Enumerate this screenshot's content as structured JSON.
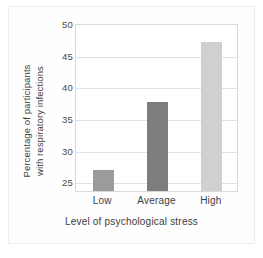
{
  "chart_data": {
    "type": "bar",
    "title": "",
    "categories": [
      "Low",
      "Average",
      "High"
    ],
    "values": [
      26.8,
      37.5,
      47.0
    ],
    "series": [
      {
        "name": "Percentage of participants with respiratory infections",
        "values": [
          26.8,
          37.5,
          47.0
        ]
      }
    ],
    "bar_colors": [
      "#9b9b9b",
      "#7d7d7d",
      "#d0d0d0"
    ],
    "xlabel": "Level of psychological stress",
    "ylabel_lines": [
      "Percentage of participants",
      "with respiratory infections"
    ],
    "ylabel": "Percentage of participants with respiratory infections",
    "yticks": [
      50,
      45,
      40,
      35,
      30,
      25
    ],
    "ytick_labels": [
      "50",
      "45",
      "40",
      "35",
      "30",
      "25"
    ],
    "ylim": [
      23.5,
      50
    ],
    "grid": "horizontal",
    "legend": "none",
    "axis_color": "#d9d9d9",
    "gridline_color": "#e2e2e2",
    "plot_background": "#ffffff",
    "figure_background": "#fefefe"
  }
}
